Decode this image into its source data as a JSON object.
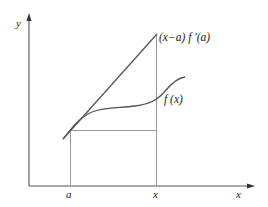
{
  "diagram": {
    "axes": {
      "y_label": "y",
      "x_label": "x"
    },
    "tick_labels": {
      "a": "a",
      "x": "x"
    },
    "curve_labels": {
      "tangent": "(x−a) f ′(a)",
      "function": "f (x)"
    },
    "colors": {
      "axis": "#555555",
      "tangent": "#555555",
      "curve": "#555555",
      "guides": "#999999",
      "text": "#222222"
    }
  }
}
